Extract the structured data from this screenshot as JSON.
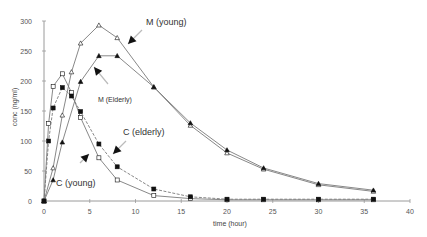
{
  "chart_data": {
    "type": "line",
    "title": "",
    "xlabel": "time (hour)",
    "ylabel": "conc (ng/ml)",
    "xlim": [
      0,
      40
    ],
    "ylim": [
      0,
      300
    ],
    "xticks": [
      0,
      5,
      10,
      15,
      20,
      25,
      30,
      35,
      40
    ],
    "yticks": [
      0,
      50,
      100,
      150,
      200,
      250,
      300
    ],
    "grid": false,
    "legend": "none (inline annotations with arrows)",
    "series": [
      {
        "name": "M (young)",
        "marker": "open-triangle",
        "x": [
          0,
          1,
          2,
          3,
          4,
          6,
          8,
          12,
          16,
          20,
          24,
          30,
          36
        ],
        "y": [
          0,
          55,
          143,
          215,
          263,
          293,
          272,
          190,
          126,
          80,
          53,
          27,
          16
        ]
      },
      {
        "name": "M (Elderly)",
        "marker": "filled-triangle",
        "x": [
          0,
          1,
          2,
          4,
          6,
          8,
          12,
          16,
          20,
          24,
          30,
          36
        ],
        "y": [
          0,
          35,
          98,
          199,
          242,
          242,
          190,
          130,
          85,
          55,
          29,
          18
        ]
      },
      {
        "name": "C (young)",
        "marker": "open-square",
        "x": [
          0,
          0.5,
          1,
          2,
          3,
          4,
          6,
          8,
          12,
          16,
          20,
          24,
          30,
          36
        ],
        "y": [
          0,
          129,
          191,
          212,
          181,
          139,
          72,
          35,
          9,
          4,
          2,
          2,
          2,
          2
        ]
      },
      {
        "name": "C (elderly)",
        "marker": "filled-square",
        "x": [
          0,
          0.5,
          1,
          2,
          3,
          4,
          6,
          8,
          12,
          16,
          20,
          24,
          30,
          36
        ],
        "y": [
          0,
          100,
          155,
          189,
          175,
          149,
          95,
          57,
          20,
          7,
          3,
          3,
          3,
          3
        ]
      }
    ],
    "annotations": [
      {
        "text": "M (young)",
        "x_px": 146,
        "y_px": 25,
        "arrow_head_px": [
          128,
          44
        ],
        "arrow_tail_px": [
          142,
          30
        ]
      },
      {
        "text": "M (Elderly)",
        "x_px": 98,
        "y_px": 102,
        "arrow_head_px": [
          94,
          67
        ],
        "arrow_tail_px": [
          108,
          84
        ]
      },
      {
        "text": "C (elderly)",
        "x_px": 123,
        "y_px": 135,
        "arrow_head_px": [
          113,
          154
        ],
        "arrow_tail_px": [
          126,
          141
        ]
      },
      {
        "text": "C (young)",
        "x_px": 56,
        "y_px": 186,
        "arrow_head_px": [
          89,
          154
        ],
        "arrow_tail_px": [
          80,
          163
        ]
      }
    ]
  },
  "colors": {
    "axis": "#9a9a9a",
    "line": "#7a7a7a",
    "marker": "#111111",
    "text": "#333333"
  }
}
